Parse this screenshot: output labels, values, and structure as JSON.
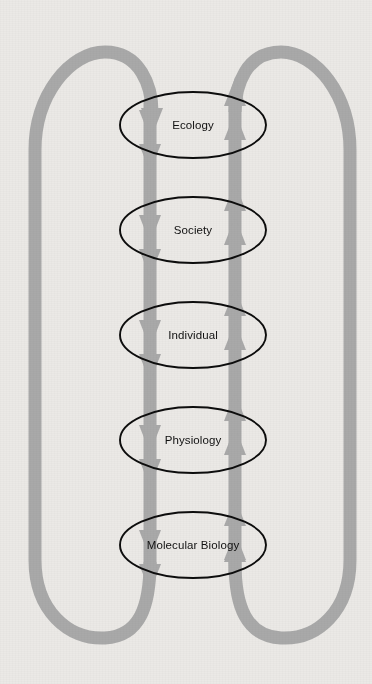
{
  "figure": {
    "background_color": "#ebe9e6",
    "band_color": "#a9a9a9",
    "outline_color": "#0d0d0d",
    "label_color": "#111111"
  },
  "nodes": [
    {
      "id": "ecology",
      "label": "Ecology",
      "cx": 193,
      "cy": 125,
      "rx": 73,
      "ry": 33
    },
    {
      "id": "society",
      "label": "Society",
      "cx": 193,
      "cy": 230,
      "rx": 73,
      "ry": 33
    },
    {
      "id": "individual",
      "label": "Individual",
      "cx": 193,
      "cy": 335,
      "rx": 73,
      "ry": 33
    },
    {
      "id": "physiology",
      "label": "Physiology",
      "cx": 193,
      "cy": 440,
      "rx": 73,
      "ry": 33
    },
    {
      "id": "molecular-biology",
      "label": "Molecular Biology",
      "cx": 193,
      "cy": 545,
      "rx": 73,
      "ry": 33
    }
  ],
  "flows": {
    "downward": {
      "name": "top-down-influence",
      "direction": "down",
      "x": 150,
      "description": "Grey band descending from Ecology through Society, Individual, Physiology to Molecular Biology"
    },
    "upward": {
      "name": "bottom-up-influence",
      "direction": "up",
      "x": 235,
      "description": "Grey band ascending from Molecular Biology through Physiology, Individual, Society to Ecology"
    },
    "outer_left": {
      "name": "left-feedback-loop",
      "description": "Outer loop on the left returning from bottom of Molecular Biology up and over into the top of Ecology"
    },
    "outer_right": {
      "name": "right-feedback-loop",
      "description": "Outer loop on the right returning from top of Ecology down and around into the bottom of Molecular Biology"
    }
  },
  "arrowhead_rows": [
    125,
    230,
    335,
    440,
    545
  ]
}
